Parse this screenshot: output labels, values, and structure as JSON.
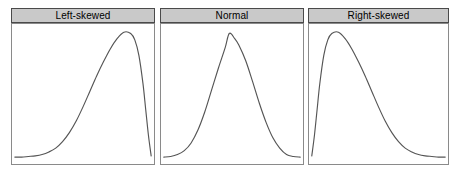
{
  "figure": {
    "name": "distribution-shapes-figure",
    "background_color": "#ffffff",
    "panel_count": 3
  },
  "style": {
    "title_bar_fill": "#c9c9c9",
    "title_bar_border": "#4a4a4a",
    "title_text_color": "#000000",
    "plot_border": "#8a8a8a",
    "plot_background": "#ffffff",
    "curve_color": "#555555"
  },
  "panels": [
    {
      "title": "Left-skewed",
      "curve_name": "left-skewed-curve"
    },
    {
      "title": "Normal",
      "curve_name": "normal-curve"
    },
    {
      "title": "Right-skewed",
      "curve_name": "right-skewed-curve"
    }
  ],
  "chart_data": [
    {
      "type": "line",
      "title": "Left-skewed",
      "xlabel": "",
      "ylabel": "",
      "xlim": [
        0,
        100
      ],
      "ylim": [
        0,
        100
      ],
      "grid": false,
      "legend": "none",
      "series": [
        {
          "name": "Left-skewed density",
          "x": [
            0,
            5,
            10,
            15,
            20,
            25,
            30,
            35,
            40,
            45,
            50,
            55,
            60,
            65,
            70,
            75,
            80,
            85,
            88,
            91,
            94,
            96,
            98,
            100
          ],
          "y": [
            1,
            1,
            1.5,
            2,
            3,
            5,
            8,
            13,
            20,
            29,
            40,
            52,
            64,
            75,
            85,
            93,
            98,
            97,
            92,
            80,
            58,
            38,
            18,
            2
          ]
        }
      ]
    },
    {
      "type": "line",
      "title": "Normal",
      "xlabel": "",
      "ylabel": "",
      "xlim": [
        0,
        100
      ],
      "ylim": [
        0,
        100
      ],
      "grid": false,
      "legend": "none",
      "series": [
        {
          "name": "Normal density",
          "x": [
            0,
            5,
            10,
            15,
            20,
            25,
            30,
            35,
            40,
            45,
            48,
            52,
            55,
            60,
            65,
            70,
            75,
            80,
            85,
            90,
            95,
            100
          ],
          "y": [
            1,
            1.5,
            3,
            6,
            12,
            22,
            36,
            53,
            70,
            86,
            97,
            93,
            88,
            76,
            60,
            43,
            28,
            16,
            8,
            3,
            1.5,
            1
          ]
        }
      ]
    },
    {
      "type": "line",
      "title": "Right-skewed",
      "xlabel": "",
      "ylabel": "",
      "xlim": [
        0,
        100
      ],
      "ylim": [
        0,
        100
      ],
      "grid": false,
      "legend": "none",
      "series": [
        {
          "name": "Right-skewed density",
          "x": [
            0,
            2,
            4,
            6,
            9,
            12,
            15,
            20,
            25,
            30,
            35,
            40,
            45,
            50,
            55,
            60,
            65,
            70,
            75,
            80,
            85,
            90,
            95,
            100
          ],
          "y": [
            2,
            18,
            38,
            58,
            80,
            92,
            97,
            98,
            93,
            85,
            75,
            64,
            52,
            40,
            29,
            20,
            13,
            8,
            5,
            3,
            2,
            1.5,
            1,
            1
          ]
        }
      ]
    }
  ]
}
